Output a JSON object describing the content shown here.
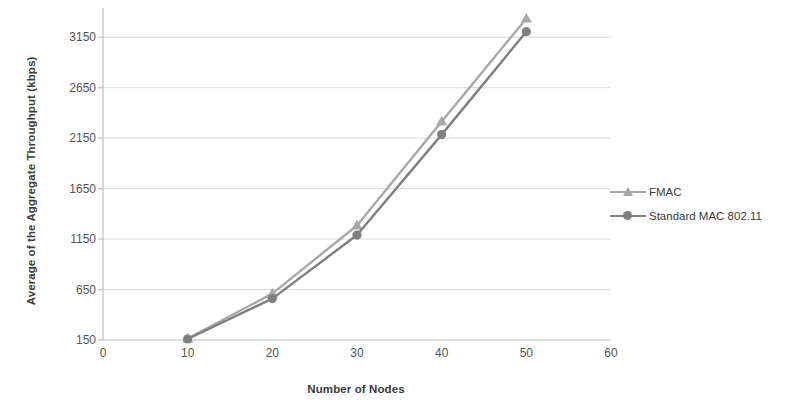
{
  "chart_data": {
    "type": "line",
    "title": "",
    "xlabel": "Number of Nodes",
    "ylabel": "Average of the Aggregate Throughput (kbps)",
    "x": [
      10,
      20,
      30,
      40,
      50
    ],
    "xlim": [
      0,
      60
    ],
    "ylim": [
      150,
      3400
    ],
    "xticks": [
      "0",
      "10",
      "20",
      "30",
      "40",
      "50",
      "60"
    ],
    "xtick_values": [
      0,
      10,
      20,
      30,
      40,
      50,
      60
    ],
    "yticks": [
      "150",
      "650",
      "1150",
      "1650",
      "2150",
      "2650",
      "3150"
    ],
    "ytick_values": [
      150,
      650,
      1150,
      1650,
      2150,
      2650,
      3150
    ],
    "grid": "horizontal",
    "legend_position": "right",
    "series": [
      {
        "name": "FMAC",
        "color": "#a8a8a8",
        "marker": "triangle",
        "values": [
          165,
          610,
          1285,
          2315,
          3335
        ]
      },
      {
        "name": "Standard MAC 802.11",
        "color": "#7f7f7f",
        "marker": "circle",
        "values": [
          160,
          560,
          1190,
          2185,
          3205
        ]
      }
    ]
  },
  "axes": {
    "axis_line_color": "#bfbfbf",
    "grid_color": "#d9d9d9",
    "tick_label_color": "#555555"
  },
  "legend": {
    "items": [
      {
        "label": "FMAC",
        "color": "#a8a8a8",
        "marker": "triangle-icon"
      },
      {
        "label": "Standard MAC 802.11",
        "color": "#7f7f7f",
        "marker": "circle-icon"
      }
    ]
  }
}
